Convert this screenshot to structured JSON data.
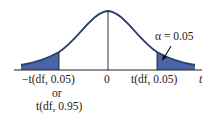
{
  "diagram": {
    "type": "t-distribution one/two-tailed critical region",
    "colors": {
      "curve": "#2c3e6e",
      "shade": "#4a64a6",
      "axis": "#222222"
    },
    "alpha_label": "α = 0.05",
    "axis_variable": "t",
    "center_label": "0",
    "left_critical": {
      "line1": "−t(df, 0.05)",
      "line2": "or",
      "line3": "t(df, 0.95)"
    },
    "right_critical": "t(df, 0.05)"
  }
}
